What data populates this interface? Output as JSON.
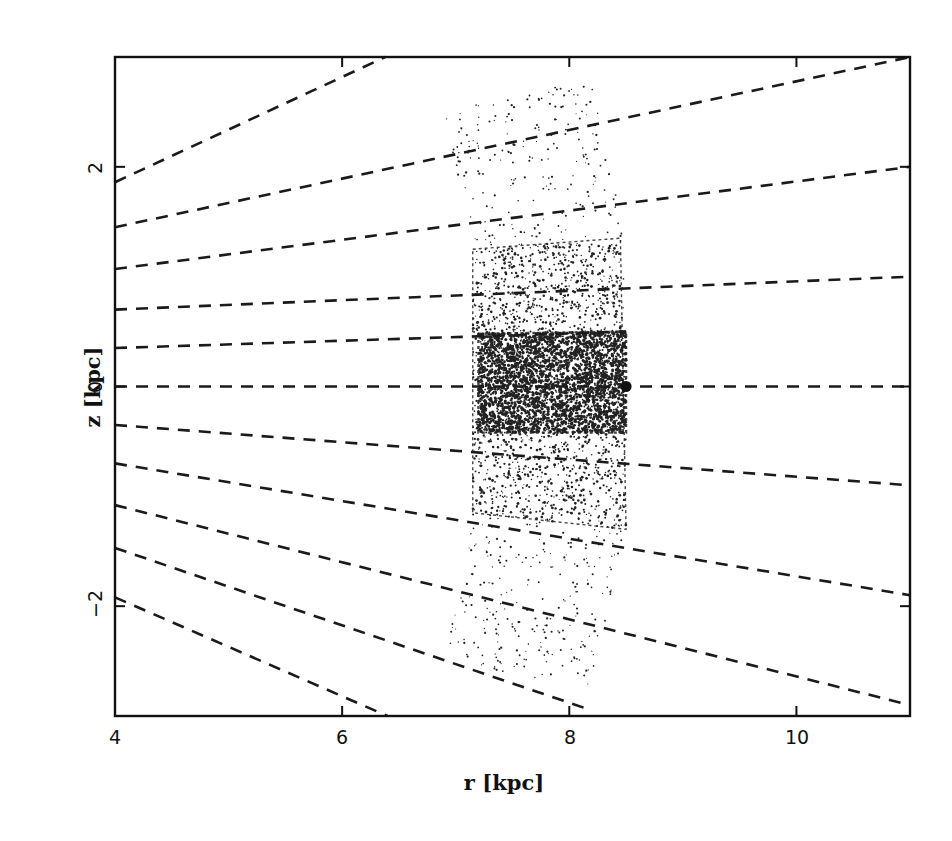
{
  "chart_data": {
    "type": "scatter",
    "title": "",
    "xlabel": "r [kpc]",
    "ylabel": "z [kpc]",
    "xlim": [
      4,
      11
    ],
    "ylim": [
      -3,
      3
    ],
    "xticks": [
      4,
      6,
      8,
      10
    ],
    "xtick_labels": [
      "4",
      "6",
      "8",
      "10"
    ],
    "yticks": [
      -2,
      0,
      2
    ],
    "ytick_labels": [
      "−2",
      "0",
      "2"
    ],
    "grid": false,
    "legend": null,
    "annotations": [
      {
        "type": "marker",
        "label": "sun-position",
        "r": 8.5,
        "z": 0.0,
        "shape": "filled-circle"
      }
    ],
    "dashed_sightlines": [
      {
        "from": [
          4,
          1.86
        ],
        "to": [
          6.38,
          3.0
        ]
      },
      {
        "from": [
          4,
          1.45
        ],
        "to": [
          11,
          3.0
        ]
      },
      {
        "from": [
          4,
          1.07
        ],
        "to": [
          11,
          2.0
        ]
      },
      {
        "from": [
          4,
          0.7
        ],
        "to": [
          11,
          1.0
        ]
      },
      {
        "from": [
          4,
          0.35
        ],
        "to": [
          8.5,
          0.5
        ]
      },
      {
        "from": [
          4,
          0.0
        ],
        "to": [
          11,
          0.0
        ]
      },
      {
        "from": [
          4,
          -0.35
        ],
        "to": [
          11,
          -0.9
        ]
      },
      {
        "from": [
          4,
          -0.7
        ],
        "to": [
          11,
          -1.9
        ]
      },
      {
        "from": [
          4,
          -1.08
        ],
        "to": [
          11,
          -2.9
        ]
      },
      {
        "from": [
          4,
          -1.47
        ],
        "to": [
          8.2,
          -2.95
        ]
      },
      {
        "from": [
          4,
          -1.92
        ],
        "to": [
          6.4,
          -3.0
        ]
      }
    ],
    "sample_regions": [
      {
        "name": "outer-sparse",
        "density": "low",
        "polygon": [
          [
            6.9,
            2.5
          ],
          [
            8.2,
            2.8
          ],
          [
            8.5,
            1.3
          ],
          [
            8.5,
            -1.3
          ],
          [
            8.2,
            -2.75
          ],
          [
            6.9,
            -2.5
          ],
          [
            7.15,
            -1.15
          ],
          [
            7.15,
            1.25
          ]
        ]
      },
      {
        "name": "middle",
        "density": "medium",
        "polygon": [
          [
            7.15,
            1.25
          ],
          [
            8.45,
            1.35
          ],
          [
            8.5,
            -1.3
          ],
          [
            7.15,
            -1.15
          ]
        ]
      },
      {
        "name": "inner-dense",
        "density": "high",
        "polygon": [
          [
            7.2,
            0.48
          ],
          [
            8.5,
            0.5
          ],
          [
            8.5,
            -0.42
          ],
          [
            7.2,
            -0.42
          ]
        ]
      }
    ]
  },
  "axes": {
    "x_title": "r [kpc]",
    "y_title": "z [kpc]",
    "x_ticks": [
      "4",
      "6",
      "8",
      "10"
    ],
    "y_ticks": [
      "2",
      "0",
      "−2"
    ]
  }
}
